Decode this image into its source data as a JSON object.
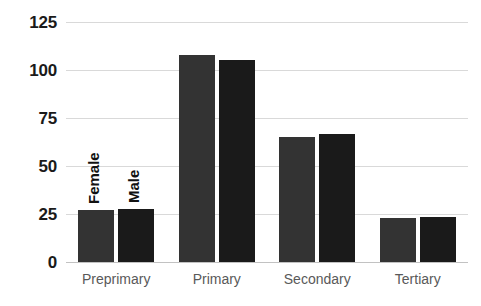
{
  "chart_data": {
    "type": "bar",
    "title": "",
    "xlabel": "",
    "ylabel": "",
    "categories": [
      "Preprimary",
      "Primary",
      "Secondary",
      "Tertiary"
    ],
    "series": [
      {
        "name": "Female",
        "color": "#333333",
        "values": [
          27,
          108,
          65,
          23
        ]
      },
      {
        "name": "Male",
        "color": "#1a1a1a",
        "values": [
          27.5,
          105,
          66.5,
          23.5
        ]
      }
    ],
    "ylim": [
      0,
      125
    ],
    "yticks": [
      0,
      25,
      50,
      75,
      100,
      125
    ],
    "ytick_labels": [
      "0",
      "25",
      "50",
      "75",
      "100",
      "125"
    ],
    "grid": true,
    "legend_position": "inline-above-first-group",
    "gridline_color": "#d9d9d9",
    "axis_label_color": "#595959",
    "tick_label_color": "#1a1a1a",
    "background_color": "#ffffff"
  }
}
